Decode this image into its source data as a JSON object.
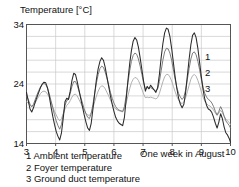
{
  "chart_data": {
    "type": "line",
    "title": "Temperature [°C]",
    "xlabel": "One week in August",
    "ylabel": "Temperature [°C]",
    "xlim": [
      3,
      10
    ],
    "ylim": [
      14,
      34
    ],
    "xticks": [
      "3",
      "4",
      "5",
      "6",
      "7",
      "8",
      "9",
      "10"
    ],
    "yticks": [
      "34",
      "24",
      "14"
    ],
    "grid": true,
    "grid_step_y": 2,
    "legend_position": "below-left",
    "curve_tags": [
      "1",
      "2",
      "3"
    ],
    "colors": {
      "series1": "#2b2b2b",
      "series2": "#6e6e6e",
      "series3": "#a8a8a8",
      "grid": "#c9c9c9",
      "axis": "#555555"
    },
    "series": [
      {
        "name": "Ambient temperature",
        "tag": "1",
        "color": "#2b2b2b",
        "x": [
          3.0,
          3.06,
          3.12,
          3.18,
          3.24,
          3.3,
          3.36,
          3.42,
          3.48,
          3.54,
          3.6,
          3.66,
          3.72,
          3.78,
          3.84,
          3.9,
          3.96,
          4.02,
          4.08,
          4.14,
          4.2,
          4.26,
          4.32,
          4.38,
          4.44,
          4.5,
          4.56,
          4.62,
          4.68,
          4.74,
          4.8,
          4.86,
          4.92,
          4.98,
          5.04,
          5.1,
          5.16,
          5.22,
          5.28,
          5.34,
          5.4,
          5.46,
          5.52,
          5.58,
          5.64,
          5.7,
          5.76,
          5.82,
          5.88,
          5.94,
          6.0,
          6.06,
          6.12,
          6.18,
          6.24,
          6.3,
          6.36,
          6.42,
          6.48,
          6.54,
          6.6,
          6.66,
          6.72,
          6.78,
          6.84,
          6.9,
          6.96,
          7.02,
          7.08,
          7.14,
          7.2,
          7.26,
          7.32,
          7.38,
          7.44,
          7.5,
          7.56,
          7.62,
          7.68,
          7.74,
          7.8,
          7.86,
          7.92,
          7.98,
          8.04,
          8.1,
          8.16,
          8.22,
          8.28,
          8.34,
          8.4,
          8.46,
          8.52,
          8.58,
          8.64,
          8.7,
          8.76,
          8.82,
          8.88,
          8.94,
          9.0,
          9.06,
          9.12,
          9.18,
          9.24,
          9.3,
          9.36,
          9.42,
          9.48,
          9.54,
          9.6,
          9.66,
          9.72,
          9.78,
          9.84,
          9.9,
          9.96,
          10.0
        ],
        "y": [
          22.6,
          21.2,
          19.8,
          19.3,
          20.0,
          21.0,
          21.8,
          22.6,
          23.4,
          24.0,
          24.3,
          24.2,
          23.4,
          22.0,
          20.2,
          18.6,
          17.2,
          16.0,
          15.2,
          14.6,
          15.8,
          18.2,
          21.0,
          21.6,
          21.4,
          22.8,
          24.6,
          25.8,
          25.6,
          24.4,
          23.0,
          21.6,
          20.2,
          18.8,
          17.6,
          16.6,
          16.2,
          17.4,
          19.8,
          22.4,
          24.8,
          26.6,
          27.8,
          28.4,
          28.0,
          26.8,
          25.2,
          23.6,
          22.0,
          20.6,
          19.4,
          18.4,
          17.8,
          17.4,
          17.2,
          17.0,
          18.4,
          21.4,
          24.6,
          27.4,
          29.6,
          31.2,
          31.8,
          31.4,
          30.2,
          28.4,
          26.4,
          24.4,
          22.8,
          23.6,
          23.2,
          23.8,
          23.4,
          23.0,
          22.6,
          23.4,
          25.6,
          28.4,
          30.8,
          32.6,
          33.4,
          33.2,
          32.0,
          30.0,
          27.6,
          25.2,
          23.2,
          21.6,
          20.6,
          20.0,
          20.6,
          22.6,
          25.4,
          28.2,
          30.6,
          32.2,
          32.6,
          31.8,
          30.0,
          27.6,
          25.2,
          23.0,
          21.4,
          20.4,
          19.8,
          19.6,
          19.2,
          18.4,
          17.4,
          16.6,
          17.6,
          19.0,
          18.2,
          16.8,
          15.8,
          15.4,
          14.8,
          14.2
        ]
      },
      {
        "name": "Foyer temperature",
        "tag": "2",
        "color": "#6e6e6e",
        "x": [
          3.0,
          3.06,
          3.12,
          3.18,
          3.24,
          3.3,
          3.36,
          3.42,
          3.48,
          3.54,
          3.6,
          3.66,
          3.72,
          3.78,
          3.84,
          3.9,
          3.96,
          4.02,
          4.08,
          4.14,
          4.2,
          4.26,
          4.32,
          4.38,
          4.44,
          4.5,
          4.56,
          4.62,
          4.68,
          4.74,
          4.8,
          4.86,
          4.92,
          4.98,
          5.04,
          5.1,
          5.16,
          5.22,
          5.28,
          5.34,
          5.4,
          5.46,
          5.52,
          5.58,
          5.64,
          5.7,
          5.76,
          5.82,
          5.88,
          5.94,
          6.0,
          6.06,
          6.12,
          6.18,
          6.24,
          6.3,
          6.36,
          6.42,
          6.48,
          6.54,
          6.6,
          6.66,
          6.72,
          6.78,
          6.84,
          6.9,
          6.96,
          7.02,
          7.08,
          7.14,
          7.2,
          7.26,
          7.32,
          7.38,
          7.44,
          7.5,
          7.56,
          7.62,
          7.68,
          7.74,
          7.8,
          7.86,
          7.92,
          7.98,
          8.04,
          8.1,
          8.16,
          8.22,
          8.28,
          8.34,
          8.4,
          8.46,
          8.52,
          8.58,
          8.64,
          8.7,
          8.76,
          8.82,
          8.88,
          8.94,
          9.0,
          9.06,
          9.12,
          9.18,
          9.24,
          9.3,
          9.36,
          9.42,
          9.48,
          9.54,
          9.6,
          9.66,
          9.72,
          9.78,
          9.84,
          9.9,
          9.96,
          10.0
        ],
        "y": [
          22.0,
          21.4,
          20.6,
          20.2,
          20.6,
          21.4,
          22.2,
          22.9,
          23.5,
          23.9,
          24.1,
          23.9,
          23.3,
          22.4,
          21.2,
          20.0,
          18.8,
          17.8,
          17.0,
          16.4,
          17.2,
          18.8,
          20.4,
          21.2,
          21.4,
          22.4,
          23.6,
          24.4,
          24.4,
          23.8,
          22.8,
          21.8,
          20.8,
          19.8,
          19.0,
          18.4,
          18.2,
          19.0,
          20.6,
          22.4,
          24.2,
          25.6,
          26.6,
          27.0,
          26.8,
          26.0,
          25.0,
          23.8,
          22.6,
          21.6,
          20.8,
          20.2,
          19.8,
          19.6,
          19.5,
          19.4,
          20.2,
          22.0,
          24.2,
          26.2,
          27.8,
          28.8,
          29.2,
          29.0,
          28.2,
          27.0,
          25.6,
          24.2,
          23.2,
          23.4,
          23.2,
          23.4,
          23.2,
          23.0,
          22.8,
          23.2,
          24.4,
          26.2,
          28.0,
          29.4,
          30.0,
          29.9,
          29.2,
          28.0,
          26.4,
          24.8,
          23.4,
          22.4,
          21.8,
          21.4,
          21.8,
          23.0,
          24.8,
          26.6,
          28.2,
          29.2,
          29.4,
          28.9,
          27.8,
          26.4,
          24.8,
          23.4,
          22.4,
          21.8,
          21.4,
          21.2,
          20.8,
          20.2,
          19.4,
          18.8,
          19.4,
          20.2,
          19.6,
          18.6,
          17.8,
          17.4,
          17.0,
          16.6
        ]
      },
      {
        "name": "Ground duct temperature",
        "tag": "3",
        "color": "#a8a8a8",
        "x": [
          3.0,
          3.06,
          3.12,
          3.18,
          3.24,
          3.3,
          3.36,
          3.42,
          3.48,
          3.54,
          3.6,
          3.66,
          3.72,
          3.78,
          3.84,
          3.9,
          3.96,
          4.02,
          4.08,
          4.14,
          4.2,
          4.26,
          4.32,
          4.38,
          4.44,
          4.5,
          4.56,
          4.62,
          4.68,
          4.74,
          4.8,
          4.86,
          4.92,
          4.98,
          5.04,
          5.1,
          5.16,
          5.22,
          5.28,
          5.34,
          5.4,
          5.46,
          5.52,
          5.58,
          5.64,
          5.7,
          5.76,
          5.82,
          5.88,
          5.94,
          6.0,
          6.06,
          6.12,
          6.18,
          6.24,
          6.3,
          6.36,
          6.42,
          6.48,
          6.54,
          6.6,
          6.66,
          6.72,
          6.78,
          6.84,
          6.9,
          6.96,
          7.02,
          7.08,
          7.14,
          7.2,
          7.26,
          7.32,
          7.38,
          7.44,
          7.5,
          7.56,
          7.62,
          7.68,
          7.74,
          7.8,
          7.86,
          7.92,
          7.98,
          8.04,
          8.1,
          8.16,
          8.22,
          8.28,
          8.34,
          8.4,
          8.46,
          8.52,
          8.58,
          8.64,
          8.7,
          8.76,
          8.82,
          8.88,
          8.94,
          9.0,
          9.06,
          9.12,
          9.18,
          9.24,
          9.3,
          9.36,
          9.42,
          9.48,
          9.54,
          9.6,
          9.66,
          9.72,
          9.78,
          9.84,
          9.9,
          9.96,
          10.0
        ],
        "y": [
          21.0,
          20.8,
          20.4,
          20.2,
          20.4,
          20.8,
          21.4,
          21.9,
          22.4,
          22.7,
          22.8,
          22.7,
          22.3,
          21.8,
          21.0,
          20.2,
          19.4,
          18.8,
          18.2,
          17.8,
          18.2,
          19.0,
          19.8,
          20.4,
          20.7,
          21.2,
          21.8,
          22.2,
          22.3,
          22.0,
          21.4,
          20.8,
          20.2,
          19.6,
          19.1,
          18.8,
          18.7,
          19.2,
          20.0,
          21.0,
          22.0,
          22.8,
          23.4,
          23.7,
          23.6,
          23.2,
          22.6,
          22.0,
          21.3,
          20.7,
          20.2,
          19.8,
          19.6,
          19.5,
          19.4,
          19.3,
          19.8,
          20.8,
          22.0,
          23.2,
          24.2,
          24.8,
          25.1,
          25.0,
          24.6,
          23.9,
          23.1,
          22.3,
          21.7,
          21.8,
          21.7,
          21.8,
          21.7,
          21.6,
          21.5,
          21.7,
          22.4,
          23.4,
          24.4,
          25.2,
          25.6,
          25.6,
          25.2,
          24.5,
          23.6,
          22.7,
          21.9,
          21.3,
          20.9,
          20.7,
          21.0,
          21.7,
          22.7,
          23.8,
          24.8,
          25.4,
          25.6,
          25.3,
          24.6,
          23.7,
          22.7,
          21.8,
          21.1,
          20.7,
          20.4,
          20.3,
          20.0,
          19.6,
          19.1,
          18.7,
          19.1,
          19.6,
          19.2,
          18.6,
          18.1,
          17.8,
          17.5,
          17.2
        ]
      }
    ]
  },
  "legend": {
    "items": [
      "1 Ambient temperature",
      "2 Foyer temperature",
      "3 Ground duct temperature"
    ]
  }
}
